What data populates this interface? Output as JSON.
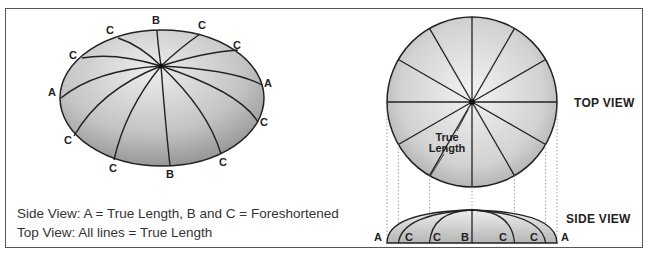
{
  "figure": {
    "left_diagram": {
      "name": "oblique-dome-view",
      "edge_labels": [
        {
          "id": "b-top",
          "text": "B",
          "x": 156,
          "y": 25
        },
        {
          "id": "c-tl1",
          "text": "C",
          "x": 110,
          "y": 35
        },
        {
          "id": "c-tr1",
          "text": "C",
          "x": 202,
          "y": 30
        },
        {
          "id": "c-tl2",
          "text": "C",
          "x": 73,
          "y": 60
        },
        {
          "id": "c-tr2",
          "text": "C",
          "x": 237,
          "y": 50
        },
        {
          "id": "a-left",
          "text": "A",
          "x": 52,
          "y": 97
        },
        {
          "id": "a-right",
          "text": "A",
          "x": 268,
          "y": 88
        },
        {
          "id": "c-bl1",
          "text": "C",
          "x": 68,
          "y": 145
        },
        {
          "id": "c-br1",
          "text": "C",
          "x": 264,
          "y": 127
        },
        {
          "id": "c-bl2",
          "text": "C",
          "x": 113,
          "y": 173
        },
        {
          "id": "c-br2",
          "text": "C",
          "x": 223,
          "y": 167
        },
        {
          "id": "b-bottom",
          "text": "B",
          "x": 170,
          "y": 179
        }
      ]
    },
    "right_diagram": {
      "top_view_label": "TOP VIEW",
      "side_view_label": "SIDE VIEW",
      "true_length_label_line1": "True",
      "true_length_label_line2": "Length",
      "side_labels": [
        {
          "id": "a-left",
          "text": "A",
          "x": 378
        },
        {
          "id": "c-1",
          "text": "C",
          "x": 409
        },
        {
          "id": "c-2",
          "text": "C",
          "x": 437
        },
        {
          "id": "b",
          "text": "B",
          "x": 465
        },
        {
          "id": "c-3",
          "text": "C",
          "x": 503
        },
        {
          "id": "c-4",
          "text": "C",
          "x": 534
        },
        {
          "id": "a-right",
          "text": "A",
          "x": 565
        }
      ]
    },
    "captions": {
      "line1": "Side View: A = True Length, B and C = Foreshortened",
      "line2": "Top View: All lines = True Length"
    },
    "colors": {
      "fill_light": "#e8e8e8",
      "fill_dark": "#9a9a9a",
      "stroke": "#222222",
      "frame": "#555555"
    }
  }
}
